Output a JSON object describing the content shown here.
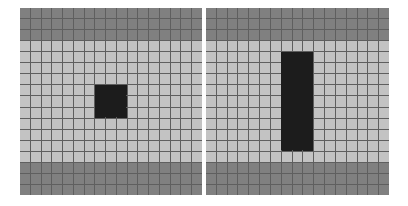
{
  "colors": {
    "band": "#808080",
    "light": "#c3c3c3",
    "object": "#1c1c1c",
    "grid_line": "#5f5f5f"
  },
  "grid": {
    "cols": 17,
    "rows": 17,
    "band_rows_top": [
      0,
      1,
      2
    ],
    "band_rows_bottom": [
      14,
      15,
      16
    ]
  },
  "panels": [
    {
      "id": "left",
      "left": 20,
      "top": 8,
      "width": 182,
      "height": 187,
      "object": {
        "shape": "square",
        "col_start": 7,
        "col_end": 9,
        "row_start": 7,
        "row_end": 9
      }
    },
    {
      "id": "right",
      "left": 206,
      "top": 8,
      "width": 183,
      "height": 187,
      "object": {
        "shape": "vertical-bar",
        "col_start": 7,
        "col_end": 9,
        "row_start": 4,
        "row_end": 12
      }
    }
  ]
}
